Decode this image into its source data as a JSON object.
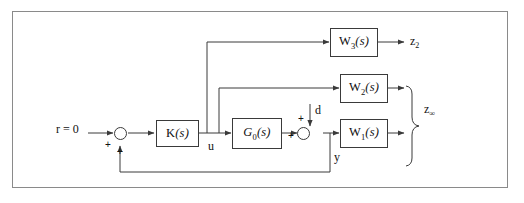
{
  "figure": {
    "background": "#ffffff",
    "border_color": "#8a8a8a",
    "line_color": "#3a3a3a"
  },
  "blocks": {
    "controller": {
      "name": "K(s)",
      "base": "K",
      "arg": "(s)"
    },
    "plant": {
      "name": "G0(s)",
      "base": "G",
      "sub": "0",
      "arg": "(s)"
    },
    "weight1": {
      "name": "W1(s)",
      "base": "W",
      "sub": "1",
      "arg": "(s)"
    },
    "weight2": {
      "name": "W2(s)",
      "base": "W",
      "sub": "2",
      "arg": "(s)"
    },
    "weight3": {
      "name": "W3(s)",
      "base": "W",
      "sub": "3",
      "arg": "(s)"
    }
  },
  "signals": {
    "reference": "r = 0",
    "control": "u",
    "disturbance": "d",
    "measurement": "y",
    "output_z2_base": "z",
    "output_z2_sub": "2",
    "output_zinf_base": "z",
    "output_zinf_sub": "∞"
  },
  "summing_junctions": [
    {
      "id": "sum-input",
      "signs": [
        "+",
        "+"
      ]
    },
    {
      "id": "sum-disturbance",
      "signs": [
        "+",
        "+"
      ]
    }
  ],
  "caption": ""
}
